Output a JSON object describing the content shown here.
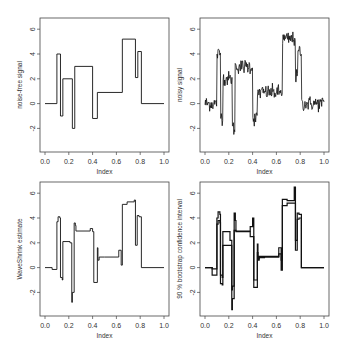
{
  "chart_data": [
    {
      "type": "line",
      "title": "",
      "xlabel": "Index",
      "ylabel": "noise-free signal",
      "xlim": [
        0.0,
        1.0
      ],
      "ylim": [
        -3.5,
        6.5
      ],
      "xticks": [
        "0.0",
        "0.2",
        "0.4",
        "0.6",
        "0.8",
        "1.0"
      ],
      "yticks": [
        "-2",
        "0",
        "2",
        "4",
        "6"
      ],
      "grid": false,
      "x": [
        0.0,
        0.1,
        0.1,
        0.13,
        0.13,
        0.15,
        0.15,
        0.23,
        0.23,
        0.25,
        0.25,
        0.4,
        0.4,
        0.44,
        0.44,
        0.65,
        0.65,
        0.76,
        0.76,
        0.78,
        0.78,
        0.81,
        0.81,
        1.0
      ],
      "y": [
        0,
        0,
        4,
        4,
        -1,
        -1,
        2,
        2,
        -2,
        -2,
        3,
        3,
        -1.2,
        -1.2,
        0.9,
        0.9,
        5.2,
        5.2,
        2.1,
        2.1,
        4.2,
        4.2,
        0,
        0
      ]
    },
    {
      "type": "line",
      "title": "",
      "xlabel": "Index",
      "ylabel": "noisy signal",
      "xlim": [
        0.0,
        1.0
      ],
      "ylim": [
        -3.5,
        6.5
      ],
      "xticks": [
        "0.0",
        "0.2",
        "0.4",
        "0.6",
        "0.8",
        "1.0"
      ],
      "yticks": [
        "-2",
        "0",
        "2",
        "4",
        "6"
      ],
      "grid": false,
      "noise_sd": 0.3,
      "x": [
        0.0,
        0.1,
        0.1,
        0.13,
        0.13,
        0.15,
        0.15,
        0.23,
        0.23,
        0.25,
        0.25,
        0.4,
        0.4,
        0.44,
        0.44,
        0.65,
        0.65,
        0.76,
        0.76,
        0.78,
        0.78,
        0.81,
        0.81,
        1.0
      ],
      "y": [
        0,
        0,
        4,
        4,
        -1,
        -1,
        2,
        2,
        -2,
        -2,
        3,
        3,
        -1.2,
        -1.2,
        0.9,
        0.9,
        5.2,
        5.2,
        2.1,
        2.1,
        4.2,
        4.2,
        0,
        0
      ]
    },
    {
      "type": "line",
      "title": "",
      "xlabel": "Index",
      "ylabel": "WaveShrink estimate",
      "xlim": [
        0.0,
        1.0
      ],
      "ylim": [
        -3.5,
        6.5
      ],
      "xticks": [
        "0.0",
        "0.2",
        "0.4",
        "0.6",
        "0.8",
        "1.0"
      ],
      "yticks": [
        "-2",
        "0",
        "2",
        "4",
        "6"
      ],
      "grid": false,
      "x": [
        0.0,
        0.06,
        0.06,
        0.1,
        0.1,
        0.11,
        0.11,
        0.125,
        0.125,
        0.13,
        0.13,
        0.145,
        0.145,
        0.15,
        0.15,
        0.21,
        0.21,
        0.225,
        0.225,
        0.23,
        0.23,
        0.245,
        0.245,
        0.255,
        0.255,
        0.26,
        0.26,
        0.38,
        0.38,
        0.4,
        0.4,
        0.41,
        0.41,
        0.44,
        0.44,
        0.445,
        0.445,
        0.455,
        0.455,
        0.5,
        0.5,
        0.62,
        0.62,
        0.64,
        0.64,
        0.65,
        0.65,
        0.69,
        0.69,
        0.75,
        0.75,
        0.76,
        0.76,
        0.775,
        0.775,
        0.79,
        0.79,
        0.81,
        0.81,
        1.0
      ],
      "y": [
        0,
        0,
        -0.15,
        -0.15,
        3.7,
        3.7,
        4.1,
        4.1,
        4.0,
        4.0,
        -0.8,
        -0.8,
        -1.0,
        -1.0,
        2.1,
        2.1,
        2.0,
        2.0,
        -2.8,
        -2.8,
        -2.0,
        -2.0,
        3.6,
        3.6,
        3.4,
        3.4,
        2.95,
        2.95,
        3.15,
        3.15,
        2.9,
        2.9,
        -1.2,
        -1.2,
        1.6,
        1.6,
        0.6,
        0.6,
        0.85,
        0.85,
        0.85,
        0.85,
        1.4,
        1.4,
        0.2,
        0.2,
        5.1,
        5.1,
        5.3,
        5.3,
        5.45,
        5.45,
        1.8,
        1.8,
        4.2,
        4.2,
        4.1,
        4.1,
        0,
        0
      ]
    },
    {
      "type": "line",
      "title": "",
      "xlabel": "Index",
      "ylabel": "90 % bootstrap confidence interval",
      "xlim": [
        0.0,
        1.0
      ],
      "ylim": [
        -3.5,
        6.5
      ],
      "xticks": [
        "0.0",
        "0.2",
        "0.4",
        "0.6",
        "0.8",
        "1.0"
      ],
      "yticks": [
        "-2",
        "0",
        "2",
        "4",
        "6"
      ],
      "grid": false,
      "x": [
        0.0,
        0.06,
        0.06,
        0.1,
        0.1,
        0.11,
        0.11,
        0.125,
        0.125,
        0.13,
        0.13,
        0.145,
        0.145,
        0.15,
        0.15,
        0.21,
        0.21,
        0.225,
        0.225,
        0.23,
        0.23,
        0.245,
        0.245,
        0.255,
        0.255,
        0.26,
        0.26,
        0.38,
        0.38,
        0.4,
        0.4,
        0.41,
        0.41,
        0.44,
        0.44,
        0.445,
        0.445,
        0.455,
        0.455,
        0.5,
        0.5,
        0.62,
        0.62,
        0.64,
        0.64,
        0.65,
        0.65,
        0.69,
        0.69,
        0.75,
        0.75,
        0.76,
        0.76,
        0.775,
        0.775,
        0.79,
        0.79,
        0.81,
        0.81,
        1.0
      ],
      "lower": [
        0,
        0,
        -0.6,
        -0.6,
        3.5,
        3.5,
        3.8,
        3.8,
        3.6,
        3.6,
        -1.3,
        -1.3,
        -1.4,
        -1.4,
        1.8,
        1.8,
        1.8,
        1.8,
        -3.4,
        -3.4,
        -2.5,
        -2.5,
        3.0,
        3.0,
        3.0,
        3.0,
        2.9,
        2.9,
        2.5,
        2.5,
        2.5,
        2.5,
        -1.6,
        -1.6,
        1.2,
        1.2,
        0.6,
        0.6,
        0.8,
        0.8,
        0.85,
        0.85,
        1.1,
        1.1,
        -0.2,
        -0.2,
        5.0,
        5.0,
        5.2,
        5.2,
        5.2,
        5.2,
        1.4,
        1.4,
        3.9,
        3.9,
        4.0,
        4.0,
        0,
        0
      ],
      "upper": [
        0,
        0,
        -0.1,
        -0.1,
        4.0,
        4.0,
        4.5,
        4.5,
        4.3,
        4.3,
        -0.6,
        -0.6,
        -0.8,
        -0.8,
        2.9,
        2.9,
        2.2,
        2.2,
        -1.8,
        -1.8,
        -1.5,
        -1.5,
        4.4,
        4.4,
        3.8,
        3.8,
        2.95,
        2.95,
        3.3,
        3.3,
        4.0,
        4.0,
        -1.0,
        -1.0,
        1.9,
        1.9,
        0.7,
        0.7,
        0.9,
        0.9,
        0.9,
        0.9,
        1.6,
        1.6,
        0.6,
        0.6,
        5.5,
        5.5,
        5.4,
        5.4,
        6.5,
        6.5,
        2.2,
        2.2,
        4.4,
        4.4,
        4.3,
        4.3,
        0,
        0
      ]
    }
  ],
  "panels": [
    {
      "ylabel": "noise-free signal",
      "xlabel": "Index"
    },
    {
      "ylabel": "noisy signal",
      "xlabel": "Index"
    },
    {
      "ylabel": "WaveShrink estimate",
      "xlabel": "Index"
    },
    {
      "ylabel": "90 % bootstrap confidence interval",
      "xlabel": "Index"
    }
  ],
  "colors": {
    "line": "#111111",
    "axis": "#444444",
    "background": "#ffffff"
  }
}
